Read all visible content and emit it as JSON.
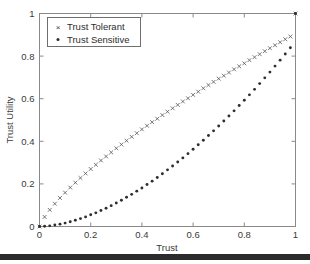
{
  "chart_data": {
    "type": "scatter",
    "title": "",
    "xlabel": "Trust",
    "ylabel": "Trust Utility",
    "xlim": [
      0,
      1
    ],
    "ylim": [
      0,
      1
    ],
    "grid": false,
    "legend_position": "top-left",
    "xticks": [
      "0",
      "0.2",
      "0.4",
      "0.6",
      "0.8",
      "1"
    ],
    "xtick_values": [
      0,
      0.2,
      0.4,
      0.6,
      0.8,
      1
    ],
    "yticks": [
      "0",
      "0.2",
      "0.4",
      "0.6",
      "0.8",
      "1"
    ],
    "ytick_values": [
      0,
      0.2,
      0.4,
      0.6,
      0.8,
      1
    ],
    "x": [
      0,
      0.02,
      0.04,
      0.06,
      0.08,
      0.1,
      0.12,
      0.14,
      0.16,
      0.18,
      0.2,
      0.22,
      0.24,
      0.26,
      0.28,
      0.3,
      0.32,
      0.34,
      0.36,
      0.38,
      0.4,
      0.42,
      0.44,
      0.46,
      0.48,
      0.5,
      0.52,
      0.54,
      0.56,
      0.58,
      0.6,
      0.62,
      0.64,
      0.66,
      0.68,
      0.7,
      0.72,
      0.74,
      0.76,
      0.78,
      0.8,
      0.82,
      0.84,
      0.86,
      0.88,
      0.9,
      0.92,
      0.94,
      0.96,
      0.98,
      1
    ],
    "series": [
      {
        "name": "Trust Tolerant",
        "marker": "x",
        "color": "#555555",
        "values": [
          0,
          0.045,
          0.078,
          0.107,
          0.134,
          0.159,
          0.183,
          0.206,
          0.228,
          0.249,
          0.27,
          0.29,
          0.31,
          0.329,
          0.348,
          0.367,
          0.385,
          0.403,
          0.421,
          0.438,
          0.456,
          0.473,
          0.49,
          0.506,
          0.523,
          0.539,
          0.555,
          0.571,
          0.587,
          0.602,
          0.618,
          0.633,
          0.649,
          0.664,
          0.679,
          0.694,
          0.708,
          0.723,
          0.738,
          0.752,
          0.766,
          0.781,
          0.795,
          0.809,
          0.823,
          0.837,
          0.851,
          0.865,
          0.879,
          0.892,
          1
        ]
      },
      {
        "name": "Trust Sensitive",
        "marker": ".",
        "color": "#2e2e2e",
        "values": [
          0,
          0.001,
          0.003,
          0.007,
          0.011,
          0.016,
          0.022,
          0.029,
          0.037,
          0.045,
          0.055,
          0.064,
          0.075,
          0.086,
          0.098,
          0.11,
          0.123,
          0.137,
          0.151,
          0.166,
          0.181,
          0.197,
          0.213,
          0.23,
          0.248,
          0.266,
          0.284,
          0.303,
          0.322,
          0.342,
          0.363,
          0.384,
          0.405,
          0.427,
          0.449,
          0.472,
          0.495,
          0.519,
          0.543,
          0.568,
          0.593,
          0.618,
          0.644,
          0.671,
          0.698,
          0.725,
          0.753,
          0.781,
          0.81,
          0.839,
          1
        ]
      }
    ]
  },
  "legend": {
    "items": [
      {
        "label": "Trust Tolerant",
        "marker": "x"
      },
      {
        "label": "Trust Sensitive",
        "marker": "dot"
      }
    ]
  },
  "axes": {
    "x_title": "Trust",
    "y_title": "Trust Utility"
  }
}
